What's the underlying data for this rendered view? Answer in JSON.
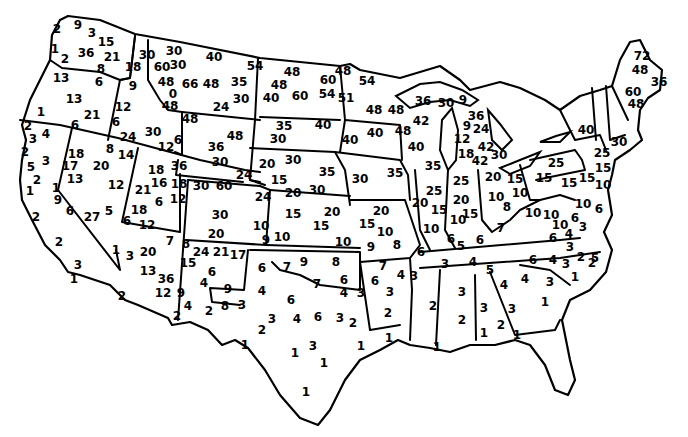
{
  "map": {
    "type": "choropleth-point-labels",
    "subject": "Contiguous United States with numeric values per location",
    "stroke_color": "#000000",
    "background_color": "#ffffff",
    "labels": [
      {
        "v": "2",
        "x": 57,
        "y": 29
      },
      {
        "v": "9",
        "x": 78,
        "y": 25
      },
      {
        "v": "3",
        "x": 92,
        "y": 33
      },
      {
        "v": "15",
        "x": 106,
        "y": 42
      },
      {
        "v": "1",
        "x": 55,
        "y": 49
      },
      {
        "v": "2",
        "x": 65,
        "y": 59
      },
      {
        "v": "36",
        "x": 86,
        "y": 53
      },
      {
        "v": "21",
        "x": 112,
        "y": 57
      },
      {
        "v": "8",
        "x": 101,
        "y": 69
      },
      {
        "v": "13",
        "x": 61,
        "y": 78
      },
      {
        "v": "6",
        "x": 99,
        "y": 82
      },
      {
        "v": "13",
        "x": 74,
        "y": 99
      },
      {
        "v": "21",
        "x": 92,
        "y": 115
      },
      {
        "v": "1",
        "x": 41,
        "y": 112
      },
      {
        "v": "6",
        "x": 75,
        "y": 125
      },
      {
        "v": "18",
        "x": 133,
        "y": 67
      },
      {
        "v": "9",
        "x": 133,
        "y": 86
      },
      {
        "v": "12",
        "x": 123,
        "y": 107
      },
      {
        "v": "6",
        "x": 116,
        "y": 122
      },
      {
        "v": "24",
        "x": 128,
        "y": 137
      },
      {
        "v": "30",
        "x": 153,
        "y": 132
      },
      {
        "v": "30",
        "x": 147,
        "y": 55
      },
      {
        "v": "30",
        "x": 174,
        "y": 51
      },
      {
        "v": "40",
        "x": 214,
        "y": 57
      },
      {
        "v": "60",
        "x": 162,
        "y": 67
      },
      {
        "v": "30",
        "x": 178,
        "y": 65
      },
      {
        "v": "48",
        "x": 166,
        "y": 82
      },
      {
        "v": "66",
        "x": 190,
        "y": 84
      },
      {
        "v": "48",
        "x": 211,
        "y": 84
      },
      {
        "v": "0",
        "x": 173,
        "y": 94
      },
      {
        "v": "48",
        "x": 170,
        "y": 106
      },
      {
        "v": "24",
        "x": 221,
        "y": 107
      },
      {
        "v": "35",
        "x": 239,
        "y": 82
      },
      {
        "v": "30",
        "x": 241,
        "y": 99
      },
      {
        "v": "54",
        "x": 255,
        "y": 66
      },
      {
        "v": "48",
        "x": 292,
        "y": 72
      },
      {
        "v": "48",
        "x": 279,
        "y": 85
      },
      {
        "v": "40",
        "x": 271,
        "y": 98
      },
      {
        "v": "60",
        "x": 300,
        "y": 96
      },
      {
        "v": "60",
        "x": 328,
        "y": 80
      },
      {
        "v": "54",
        "x": 327,
        "y": 94
      },
      {
        "v": "35",
        "x": 284,
        "y": 126
      },
      {
        "v": "30",
        "x": 278,
        "y": 139
      },
      {
        "v": "40",
        "x": 323,
        "y": 125
      },
      {
        "v": "48",
        "x": 190,
        "y": 119
      },
      {
        "v": "6",
        "x": 178,
        "y": 140
      },
      {
        "v": "36",
        "x": 216,
        "y": 147
      },
      {
        "v": "48",
        "x": 235,
        "y": 136
      },
      {
        "v": "30",
        "x": 220,
        "y": 162
      },
      {
        "v": "24",
        "x": 244,
        "y": 175
      },
      {
        "v": "12",
        "x": 166,
        "y": 147
      },
      {
        "v": "36",
        "x": 179,
        "y": 166
      },
      {
        "v": "48",
        "x": 343,
        "y": 71
      },
      {
        "v": "54",
        "x": 367,
        "y": 81
      },
      {
        "v": "51",
        "x": 346,
        "y": 98
      },
      {
        "v": "48",
        "x": 374,
        "y": 110
      },
      {
        "v": "40",
        "x": 375,
        "y": 133
      },
      {
        "v": "40",
        "x": 350,
        "y": 140
      },
      {
        "v": "48",
        "x": 396,
        "y": 110
      },
      {
        "v": "42",
        "x": 421,
        "y": 121
      },
      {
        "v": "48",
        "x": 403,
        "y": 131
      },
      {
        "v": "40",
        "x": 416,
        "y": 147
      },
      {
        "v": "36",
        "x": 423,
        "y": 101
      },
      {
        "v": "30",
        "x": 446,
        "y": 103
      },
      {
        "v": "9",
        "x": 463,
        "y": 100
      },
      {
        "v": "36",
        "x": 476,
        "y": 116
      },
      {
        "v": "9",
        "x": 467,
        "y": 126
      },
      {
        "v": "24",
        "x": 481,
        "y": 129
      },
      {
        "v": "12",
        "x": 462,
        "y": 139
      },
      {
        "v": "42",
        "x": 486,
        "y": 147
      },
      {
        "v": "18",
        "x": 466,
        "y": 154
      },
      {
        "v": "30",
        "x": 499,
        "y": 155
      },
      {
        "v": "42",
        "x": 480,
        "y": 161
      },
      {
        "v": "40",
        "x": 586,
        "y": 130
      },
      {
        "v": "72",
        "x": 642,
        "y": 56
      },
      {
        "v": "48",
        "x": 640,
        "y": 70
      },
      {
        "v": "36",
        "x": 659,
        "y": 82
      },
      {
        "v": "60",
        "x": 633,
        "y": 92
      },
      {
        "v": "48",
        "x": 636,
        "y": 104
      },
      {
        "v": "30",
        "x": 619,
        "y": 142
      },
      {
        "v": "25",
        "x": 602,
        "y": 153
      },
      {
        "v": "15",
        "x": 603,
        "y": 168
      },
      {
        "v": "10",
        "x": 603,
        "y": 185
      },
      {
        "v": "10",
        "x": 583,
        "y": 204
      },
      {
        "v": "6",
        "x": 599,
        "y": 209
      },
      {
        "v": "25",
        "x": 556,
        "y": 163
      },
      {
        "v": "15",
        "x": 544,
        "y": 178
      },
      {
        "v": "15",
        "x": 569,
        "y": 183
      },
      {
        "v": "15",
        "x": 587,
        "y": 178
      },
      {
        "v": "2",
        "x": 28,
        "y": 126
      },
      {
        "v": "4",
        "x": 46,
        "y": 134
      },
      {
        "v": "3",
        "x": 33,
        "y": 139
      },
      {
        "v": "2",
        "x": 25,
        "y": 152
      },
      {
        "v": "3",
        "x": 46,
        "y": 161
      },
      {
        "v": "5",
        "x": 31,
        "y": 167
      },
      {
        "v": "2",
        "x": 37,
        "y": 180
      },
      {
        "v": "1",
        "x": 30,
        "y": 191
      },
      {
        "v": "1",
        "x": 56,
        "y": 188
      },
      {
        "v": "9",
        "x": 58,
        "y": 200
      },
      {
        "v": "6",
        "x": 70,
        "y": 211
      },
      {
        "v": "2",
        "x": 36,
        "y": 217
      },
      {
        "v": "2",
        "x": 59,
        "y": 242
      },
      {
        "v": "3",
        "x": 78,
        "y": 265
      },
      {
        "v": "1",
        "x": 74,
        "y": 279
      },
      {
        "v": "18",
        "x": 76,
        "y": 154
      },
      {
        "v": "17",
        "x": 70,
        "y": 166
      },
      {
        "v": "13",
        "x": 75,
        "y": 179
      },
      {
        "v": "20",
        "x": 101,
        "y": 166
      },
      {
        "v": "8",
        "x": 110,
        "y": 149
      },
      {
        "v": "14",
        "x": 126,
        "y": 155
      },
      {
        "v": "12",
        "x": 116,
        "y": 185
      },
      {
        "v": "5",
        "x": 109,
        "y": 211
      },
      {
        "v": "27",
        "x": 92,
        "y": 217
      },
      {
        "v": "18",
        "x": 156,
        "y": 170
      },
      {
        "v": "21",
        "x": 143,
        "y": 190
      },
      {
        "v": "16",
        "x": 159,
        "y": 183
      },
      {
        "v": "18",
        "x": 179,
        "y": 184
      },
      {
        "v": "6",
        "x": 159,
        "y": 202
      },
      {
        "v": "12",
        "x": 178,
        "y": 199
      },
      {
        "v": "18",
        "x": 139,
        "y": 210
      },
      {
        "v": "6",
        "x": 127,
        "y": 221
      },
      {
        "v": "12",
        "x": 147,
        "y": 225
      },
      {
        "v": "30",
        "x": 201,
        "y": 186
      },
      {
        "v": "60",
        "x": 224,
        "y": 186
      },
      {
        "v": "30",
        "x": 220,
        "y": 215
      },
      {
        "v": "20",
        "x": 216,
        "y": 234
      },
      {
        "v": "24",
        "x": 263,
        "y": 197
      },
      {
        "v": "10",
        "x": 261,
        "y": 226
      },
      {
        "v": "9",
        "x": 266,
        "y": 240
      },
      {
        "v": "20",
        "x": 267,
        "y": 164
      },
      {
        "v": "30",
        "x": 293,
        "y": 160
      },
      {
        "v": "15",
        "x": 279,
        "y": 180
      },
      {
        "v": "35",
        "x": 327,
        "y": 172
      },
      {
        "v": "20",
        "x": 293,
        "y": 193
      },
      {
        "v": "30",
        "x": 317,
        "y": 190
      },
      {
        "v": "30",
        "x": 360,
        "y": 179
      },
      {
        "v": "35",
        "x": 395,
        "y": 173
      },
      {
        "v": "15",
        "x": 293,
        "y": 214
      },
      {
        "v": "20",
        "x": 332,
        "y": 212
      },
      {
        "v": "15",
        "x": 321,
        "y": 226
      },
      {
        "v": "10",
        "x": 282,
        "y": 237
      },
      {
        "v": "10",
        "x": 343,
        "y": 242
      },
      {
        "v": "15",
        "x": 367,
        "y": 224
      },
      {
        "v": "20",
        "x": 381,
        "y": 211
      },
      {
        "v": "10",
        "x": 385,
        "y": 232
      },
      {
        "v": "9",
        "x": 371,
        "y": 247
      },
      {
        "v": "8",
        "x": 397,
        "y": 245
      },
      {
        "v": "35",
        "x": 433,
        "y": 166
      },
      {
        "v": "25",
        "x": 434,
        "y": 191
      },
      {
        "v": "20",
        "x": 420,
        "y": 203
      },
      {
        "v": "15",
        "x": 439,
        "y": 210
      },
      {
        "v": "10",
        "x": 431,
        "y": 229
      },
      {
        "v": "6",
        "x": 421,
        "y": 252
      },
      {
        "v": "25",
        "x": 461,
        "y": 181
      },
      {
        "v": "20",
        "x": 461,
        "y": 200
      },
      {
        "v": "15",
        "x": 470,
        "y": 214
      },
      {
        "v": "10",
        "x": 458,
        "y": 220
      },
      {
        "v": "6",
        "x": 451,
        "y": 239
      },
      {
        "v": "5",
        "x": 461,
        "y": 246
      },
      {
        "v": "6",
        "x": 480,
        "y": 240
      },
      {
        "v": "20",
        "x": 493,
        "y": 177
      },
      {
        "v": "15",
        "x": 515,
        "y": 179
      },
      {
        "v": "10",
        "x": 496,
        "y": 197
      },
      {
        "v": "8",
        "x": 507,
        "y": 207
      },
      {
        "v": "10",
        "x": 520,
        "y": 193
      },
      {
        "v": "7",
        "x": 501,
        "y": 228
      },
      {
        "v": "10",
        "x": 533,
        "y": 213
      },
      {
        "v": "10",
        "x": 551,
        "y": 215
      },
      {
        "v": "6",
        "x": 575,
        "y": 218
      },
      {
        "v": "4",
        "x": 569,
        "y": 234
      },
      {
        "v": "10",
        "x": 560,
        "y": 225
      },
      {
        "v": "3",
        "x": 583,
        "y": 227
      },
      {
        "v": "6",
        "x": 553,
        "y": 238
      },
      {
        "v": "3",
        "x": 570,
        "y": 247
      },
      {
        "v": "2",
        "x": 581,
        "y": 257
      },
      {
        "v": "6",
        "x": 533,
        "y": 260
      },
      {
        "v": "4",
        "x": 553,
        "y": 260
      },
      {
        "v": "3",
        "x": 566,
        "y": 264
      },
      {
        "v": "1",
        "x": 575,
        "y": 277
      },
      {
        "v": "5",
        "x": 595,
        "y": 258
      },
      {
        "v": "2",
        "x": 592,
        "y": 263
      },
      {
        "v": "1",
        "x": 116,
        "y": 250
      },
      {
        "v": "3",
        "x": 130,
        "y": 256
      },
      {
        "v": "20",
        "x": 148,
        "y": 252
      },
      {
        "v": "7",
        "x": 170,
        "y": 241
      },
      {
        "v": "13",
        "x": 148,
        "y": 271
      },
      {
        "v": "36",
        "x": 166,
        "y": 279
      },
      {
        "v": "12",
        "x": 163,
        "y": 293
      },
      {
        "v": "2",
        "x": 122,
        "y": 296
      },
      {
        "v": "8",
        "x": 186,
        "y": 244
      },
      {
        "v": "24",
        "x": 201,
        "y": 252
      },
      {
        "v": "21",
        "x": 221,
        "y": 252
      },
      {
        "v": "17",
        "x": 238,
        "y": 255
      },
      {
        "v": "15",
        "x": 188,
        "y": 263
      },
      {
        "v": "6",
        "x": 212,
        "y": 272
      },
      {
        "v": "4",
        "x": 204,
        "y": 283
      },
      {
        "v": "9",
        "x": 181,
        "y": 293
      },
      {
        "v": "9",
        "x": 228,
        "y": 289
      },
      {
        "v": "4",
        "x": 188,
        "y": 306
      },
      {
        "v": "2",
        "x": 177,
        "y": 316
      },
      {
        "v": "2",
        "x": 209,
        "y": 311
      },
      {
        "v": "8",
        "x": 225,
        "y": 306
      },
      {
        "v": "3",
        "x": 242,
        "y": 305
      },
      {
        "v": "6",
        "x": 262,
        "y": 268
      },
      {
        "v": "7",
        "x": 287,
        "y": 267
      },
      {
        "v": "9",
        "x": 304,
        "y": 262
      },
      {
        "v": "8",
        "x": 336,
        "y": 262
      },
      {
        "v": "4",
        "x": 262,
        "y": 291
      },
      {
        "v": "7",
        "x": 317,
        "y": 284
      },
      {
        "v": "6",
        "x": 344,
        "y": 280
      },
      {
        "v": "4",
        "x": 344,
        "y": 293
      },
      {
        "v": "3",
        "x": 361,
        "y": 293
      },
      {
        "v": "6",
        "x": 291,
        "y": 300
      },
      {
        "v": "3",
        "x": 272,
        "y": 319
      },
      {
        "v": "2",
        "x": 262,
        "y": 330
      },
      {
        "v": "4",
        "x": 297,
        "y": 319
      },
      {
        "v": "6",
        "x": 318,
        "y": 317
      },
      {
        "v": "3",
        "x": 340,
        "y": 318
      },
      {
        "v": "2",
        "x": 353,
        "y": 323
      },
      {
        "v": "1",
        "x": 245,
        "y": 345
      },
      {
        "v": "1",
        "x": 295,
        "y": 353
      },
      {
        "v": "3",
        "x": 313,
        "y": 346
      },
      {
        "v": "1",
        "x": 361,
        "y": 346
      },
      {
        "v": "1",
        "x": 324,
        "y": 363
      },
      {
        "v": "1",
        "x": 306,
        "y": 392
      },
      {
        "v": "7",
        "x": 383,
        "y": 266
      },
      {
        "v": "6",
        "x": 375,
        "y": 281
      },
      {
        "v": "4",
        "x": 401,
        "y": 275
      },
      {
        "v": "3",
        "x": 414,
        "y": 276
      },
      {
        "v": "3",
        "x": 390,
        "y": 292
      },
      {
        "v": "2",
        "x": 388,
        "y": 313
      },
      {
        "v": "1",
        "x": 389,
        "y": 338
      },
      {
        "v": "3",
        "x": 445,
        "y": 264
      },
      {
        "v": "4",
        "x": 473,
        "y": 262
      },
      {
        "v": "5",
        "x": 490,
        "y": 270
      },
      {
        "v": "2",
        "x": 433,
        "y": 306
      },
      {
        "v": "1",
        "x": 437,
        "y": 347
      },
      {
        "v": "3",
        "x": 462,
        "y": 292
      },
      {
        "v": "2",
        "x": 462,
        "y": 320
      },
      {
        "v": "1",
        "x": 484,
        "y": 333
      },
      {
        "v": "3",
        "x": 484,
        "y": 308
      },
      {
        "v": "3",
        "x": 512,
        "y": 309
      },
      {
        "v": "2",
        "x": 501,
        "y": 325
      },
      {
        "v": "1",
        "x": 517,
        "y": 335
      },
      {
        "v": "4",
        "x": 504,
        "y": 285
      },
      {
        "v": "4",
        "x": 525,
        "y": 279
      },
      {
        "v": "3",
        "x": 550,
        "y": 282
      },
      {
        "v": "1",
        "x": 545,
        "y": 302
      }
    ]
  }
}
